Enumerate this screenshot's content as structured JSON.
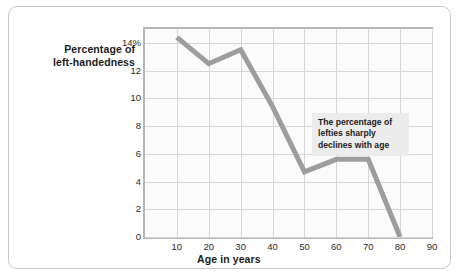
{
  "chart_data": {
    "type": "line",
    "title": "",
    "xlabel": "Age in years",
    "ylabel": "Percentage of left-handedness",
    "ylabel_line1": "Percentage of",
    "ylabel_line2": "left-handedness",
    "x": [
      10,
      20,
      30,
      40,
      50,
      60,
      70,
      80
    ],
    "values": [
      14.4,
      12.5,
      13.5,
      9.4,
      4.7,
      5.6,
      5.6,
      0
    ],
    "series": [
      {
        "name": "Percentage of left-handedness",
        "values": [
          14.4,
          12.5,
          13.5,
          9.4,
          4.7,
          5.6,
          5.6,
          0
        ],
        "color": "#9d9d9d"
      }
    ],
    "xlim": [
      0,
      90
    ],
    "ylim": [
      0,
      15
    ],
    "xticks": [
      "10",
      "20",
      "30",
      "40",
      "50",
      "60",
      "70",
      "80",
      "90"
    ],
    "xtick_values": [
      10,
      20,
      30,
      40,
      50,
      60,
      70,
      80,
      90
    ],
    "yticks": [
      "0",
      "2",
      "4",
      "6",
      "8",
      "10",
      "12",
      "14%"
    ],
    "ytick_values": [
      0,
      2,
      4,
      6,
      8,
      10,
      12,
      14
    ],
    "grid": true,
    "legend": "none",
    "annotations": [
      {
        "text": "The percentage of lefties sharply declines with age",
        "line1": "The percentage of",
        "line2": "lefties sharply",
        "line3": "declines with age"
      }
    ],
    "colors": {
      "line": "#9d9d9d",
      "grid": "#d6d6d6",
      "axis": "#b6b6b6",
      "plot_background": "#fbfbfb",
      "annotation_background": "#ececec",
      "card_border": "#c9c9c9",
      "text": "#1b1b1b"
    }
  }
}
